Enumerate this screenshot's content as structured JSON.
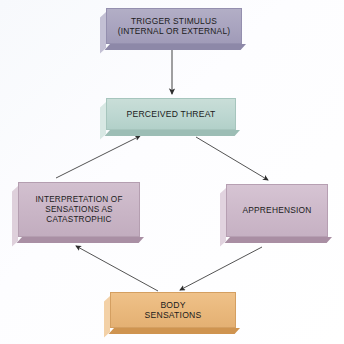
{
  "diagram": {
    "background_color": "#fbfcfe",
    "nodes": [
      {
        "id": "trigger",
        "label": "TRIGGER STIMULUS\n(INTERNAL OR EXTERNAL)",
        "color": "#a9a4bf",
        "shape": "beveled-rectangle"
      },
      {
        "id": "threat",
        "label": "PERCEIVED THREAT",
        "color": "#bdd7d1",
        "shape": "beveled-rectangle"
      },
      {
        "id": "interpretation",
        "label": "INTERPRETATION OF\nSENSATIONS AS\nCATASTROPHIC",
        "color": "#c9b5c6",
        "shape": "beveled-rectangle"
      },
      {
        "id": "apprehension",
        "label": "APPREHENSION",
        "color": "#cdb9ca",
        "shape": "beveled-rectangle"
      },
      {
        "id": "body",
        "label": "BODY\nSENSATIONS",
        "color": "#e9b87c",
        "shape": "beveled-rectangle"
      }
    ],
    "edges": [
      {
        "id": "trigger-to-threat",
        "from": "trigger",
        "to": "threat",
        "style": "straight-arrow"
      },
      {
        "id": "threat-to-apprehension",
        "from": "threat",
        "to": "apprehension",
        "style": "straight-arrow"
      },
      {
        "id": "apprehension-to-body",
        "from": "apprehension",
        "to": "body",
        "style": "straight-arrow"
      },
      {
        "id": "body-to-interpretation",
        "from": "body",
        "to": "interpretation",
        "style": "straight-arrow"
      },
      {
        "id": "interpretation-to-threat",
        "from": "interpretation",
        "to": "threat",
        "style": "straight-arrow"
      }
    ],
    "arrow_color": "#333333"
  }
}
